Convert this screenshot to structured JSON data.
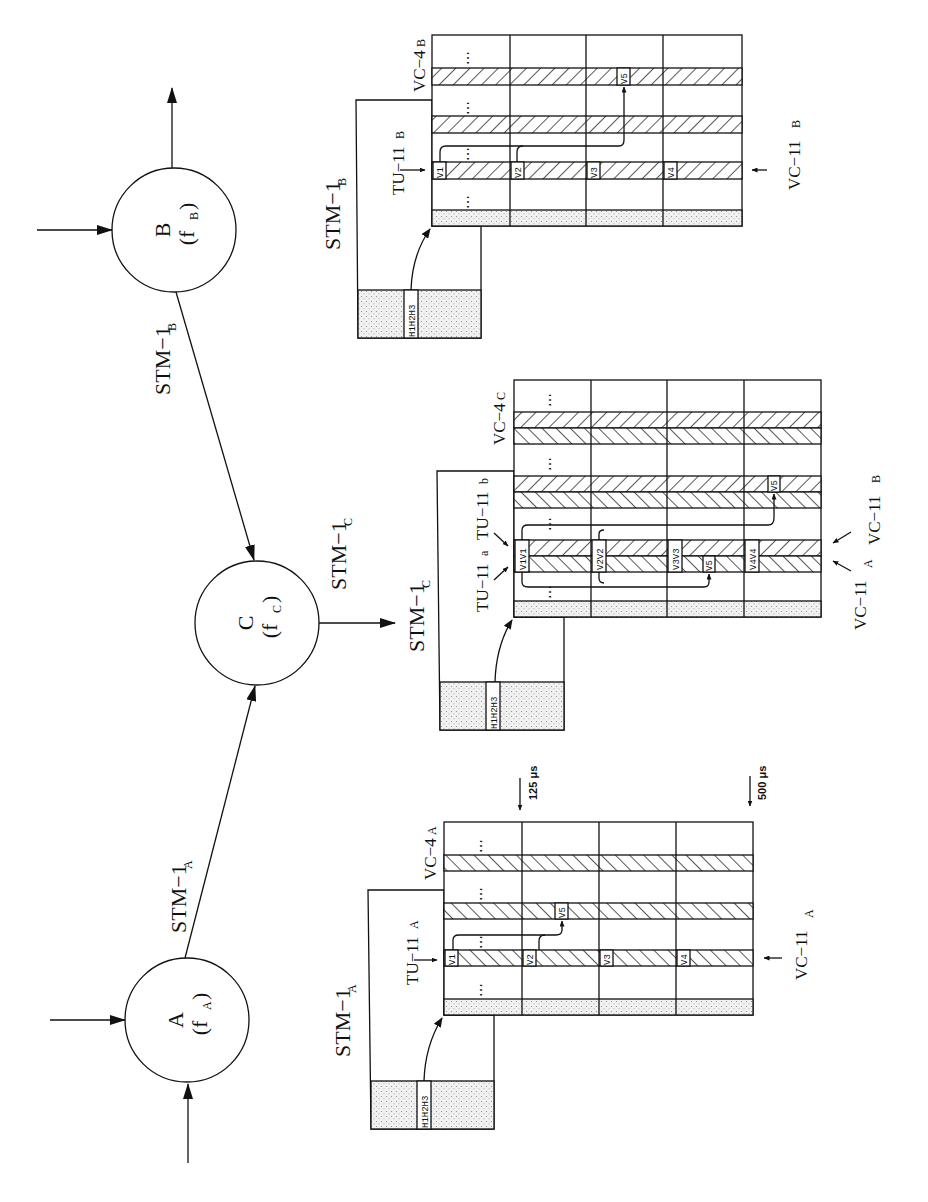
{
  "nodes": {
    "A": {
      "name": "A",
      "freq": "(f",
      "freq_sub": "A",
      "close": ")"
    },
    "B": {
      "name": "B",
      "freq": "(f",
      "freq_sub": "B",
      "close": ")"
    },
    "C": {
      "name": "C",
      "freq": "(f",
      "freq_sub": "C",
      "close": ")"
    }
  },
  "links": {
    "A_to_C": {
      "label": "STM−1",
      "sub": "A"
    },
    "B_to_C": {
      "label": "STM−1",
      "sub": "B"
    },
    "C_out": {
      "label": "STM−1",
      "sub": "C"
    }
  },
  "frames": {
    "B": {
      "stm_label": "STM−1",
      "stm_sub": "B",
      "tu_label": "TU−11",
      "tu_sub": "B",
      "vc4_label": "VC−4",
      "vc4_sub": "B",
      "vc11_label": "VC−11",
      "vc11_sub": "B",
      "pointer_label": "H1H2H3",
      "v_bytes": [
        "V1",
        "V2",
        "V3",
        "V4",
        "V5"
      ],
      "ellipsis": "⋯"
    },
    "C": {
      "stm_label": "STM−1",
      "stm_sub": "C",
      "tu_a_label": "TU−11",
      "tu_a_sub": "a",
      "tu_b_label": "TU−11",
      "tu_b_sub": "b",
      "vc4_label": "VC−4",
      "vc4_sub": "C",
      "vc11_a_label": "VC−11",
      "vc11_a_sub": "A",
      "vc11_b_label": "VC−11",
      "vc11_b_sub": "B",
      "pointer_label": "H1H2H3",
      "v_bytes": [
        "V1V1",
        "V2V2",
        "V3V3",
        "V4V4",
        "V5",
        "V5"
      ],
      "ellipsis": "⋯"
    },
    "A": {
      "stm_label": "STM−1",
      "stm_sub": "A",
      "tu_label": "TU−11",
      "tu_sub": "A",
      "vc4_label": "VC−4",
      "vc4_sub": "A",
      "vc11_label": "VC−11",
      "vc11_sub": "A",
      "pointer_label": "H1H2H3",
      "v_bytes": [
        "V1",
        "V2",
        "V3",
        "V4",
        "V5"
      ],
      "ellipsis": "⋯"
    }
  },
  "timing": {
    "frame_period": "125 μs",
    "multiframe_period": "500 μs"
  }
}
